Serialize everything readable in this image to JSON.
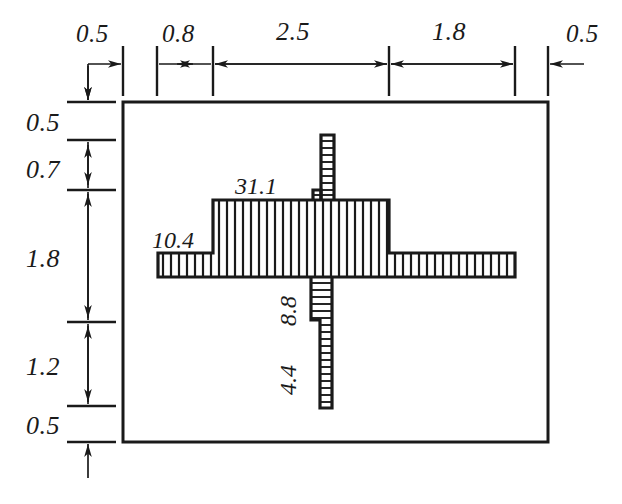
{
  "drawing": {
    "title": "Sectional dimensioned part drawing",
    "units_note": "",
    "line_color": "#1a1a1a",
    "background": "#ffffff"
  },
  "top_dimensions": {
    "orientation": "horizontal",
    "items": [
      {
        "label": "0.5",
        "value": 0.5,
        "name": "dim-top-0"
      },
      {
        "label": "0.8",
        "value": 0.8,
        "name": "dim-top-1"
      },
      {
        "label": "2.5",
        "value": 2.5,
        "name": "dim-top-2"
      },
      {
        "label": "1.8",
        "value": 1.8,
        "name": "dim-top-3"
      },
      {
        "label": "0.5",
        "value": 0.5,
        "name": "dim-top-4"
      }
    ]
  },
  "left_dimensions": {
    "orientation": "vertical",
    "items": [
      {
        "label": "0.5",
        "value": 0.5,
        "name": "dim-left-0"
      },
      {
        "label": "0.7",
        "value": 0.7,
        "name": "dim-left-1"
      },
      {
        "label": "1.8",
        "value": 1.8,
        "name": "dim-left-2"
      },
      {
        "label": "1.2",
        "value": 1.2,
        "name": "dim-left-3"
      },
      {
        "label": "0.5",
        "value": 0.5,
        "name": "dim-left-4"
      }
    ]
  },
  "part_labels": [
    {
      "label": "31.1",
      "value": 31.1,
      "name": "label-31-1",
      "rotation": 0
    },
    {
      "label": "10.4",
      "value": 10.4,
      "name": "label-10-4",
      "rotation": 0
    },
    {
      "label": "8.8",
      "value": 8.8,
      "name": "label-8-8",
      "rotation": -90
    },
    {
      "label": "4.4",
      "value": 4.4,
      "name": "label-4-4",
      "rotation": -90
    }
  ]
}
